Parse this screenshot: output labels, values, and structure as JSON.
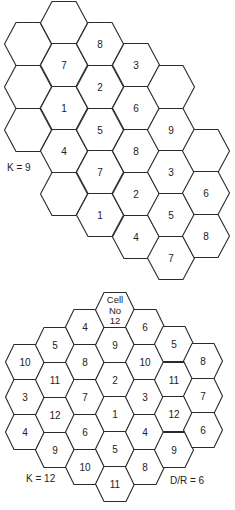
{
  "figure": {
    "top_pattern": {
      "caption": "K = 9",
      "caption_pos": [
        7,
        171
      ],
      "geometry": {
        "r": 23.5,
        "half_top": 12,
        "half_height": 21.5
      },
      "cells": [
        {
          "x": 28,
          "y": 44,
          "label": ""
        },
        {
          "x": 28,
          "y": 87,
          "label": ""
        },
        {
          "x": 28,
          "y": 130,
          "label": ""
        },
        {
          "x": 64,
          "y": 23,
          "label": ""
        },
        {
          "x": 64,
          "y": 65,
          "label": "7"
        },
        {
          "x": 64,
          "y": 108,
          "label": "1"
        },
        {
          "x": 64,
          "y": 151,
          "label": "4"
        },
        {
          "x": 64,
          "y": 194,
          "label": ""
        },
        {
          "x": 100,
          "y": 44,
          "label": "8"
        },
        {
          "x": 100,
          "y": 87,
          "label": "2"
        },
        {
          "x": 100,
          "y": 130,
          "label": "5"
        },
        {
          "x": 100,
          "y": 172,
          "label": "7"
        },
        {
          "x": 100,
          "y": 215,
          "label": "1"
        },
        {
          "x": 136,
          "y": 65,
          "label": "3"
        },
        {
          "x": 136,
          "y": 108,
          "label": "6"
        },
        {
          "x": 136,
          "y": 151,
          "label": "8"
        },
        {
          "x": 136,
          "y": 194,
          "label": "2"
        },
        {
          "x": 136,
          "y": 237,
          "label": "4"
        },
        {
          "x": 171,
          "y": 87,
          "label": ""
        },
        {
          "x": 171,
          "y": 130,
          "label": "9"
        },
        {
          "x": 171,
          "y": 172,
          "label": "3"
        },
        {
          "x": 171,
          "y": 215,
          "label": "5"
        },
        {
          "x": 171,
          "y": 258,
          "label": "7"
        },
        {
          "x": 206,
          "y": 151,
          "label": ""
        },
        {
          "x": 206,
          "y": 193,
          "label": "6"
        },
        {
          "x": 206,
          "y": 236,
          "label": "8"
        }
      ]
    },
    "bottom_pattern": {
      "caption": "K = 12",
      "caption_pos": [
        26,
        482
      ],
      "ratio_label": "D/R = 6",
      "ratio_pos": [
        170,
        484
      ],
      "geometry": {
        "r": 19.5,
        "half_top": 11,
        "half_height": 17.5
      },
      "cells": [
        {
          "x": 25,
          "y": 362,
          "label": "10"
        },
        {
          "x": 25,
          "y": 397,
          "label": "3"
        },
        {
          "x": 25,
          "y": 432,
          "label": "4"
        },
        {
          "x": 55,
          "y": 345,
          "label": "5"
        },
        {
          "x": 55,
          "y": 380,
          "label": "11"
        },
        {
          "x": 55,
          "y": 415,
          "label": "12"
        },
        {
          "x": 55,
          "y": 450,
          "label": "9"
        },
        {
          "x": 85,
          "y": 327,
          "label": "4"
        },
        {
          "x": 85,
          "y": 362,
          "label": "8"
        },
        {
          "x": 85,
          "y": 397,
          "label": "7"
        },
        {
          "x": 85,
          "y": 432,
          "label": "6"
        },
        {
          "x": 85,
          "y": 467,
          "label": "10"
        },
        {
          "x": 115,
          "y": 310,
          "label": "Cell\nNo\n12"
        },
        {
          "x": 115,
          "y": 345,
          "label": "9"
        },
        {
          "x": 115,
          "y": 380,
          "label": "2"
        },
        {
          "x": 115,
          "y": 414,
          "label": "1"
        },
        {
          "x": 115,
          "y": 449,
          "label": "5"
        },
        {
          "x": 115,
          "y": 484,
          "label": "11"
        },
        {
          "x": 145,
          "y": 327,
          "label": "6"
        },
        {
          "x": 145,
          "y": 362,
          "label": "10"
        },
        {
          "x": 145,
          "y": 397,
          "label": "3"
        },
        {
          "x": 145,
          "y": 432,
          "label": "4"
        },
        {
          "x": 145,
          "y": 467,
          "label": "8"
        },
        {
          "x": 174,
          "y": 344,
          "label": "5"
        },
        {
          "x": 174,
          "y": 380,
          "label": "11"
        },
        {
          "x": 174,
          "y": 414,
          "label": "12"
        },
        {
          "x": 174,
          "y": 450,
          "label": "9"
        },
        {
          "x": 203,
          "y": 361,
          "label": "8"
        },
        {
          "x": 203,
          "y": 396,
          "label": "7"
        },
        {
          "x": 203,
          "y": 430,
          "label": "6"
        }
      ]
    }
  }
}
